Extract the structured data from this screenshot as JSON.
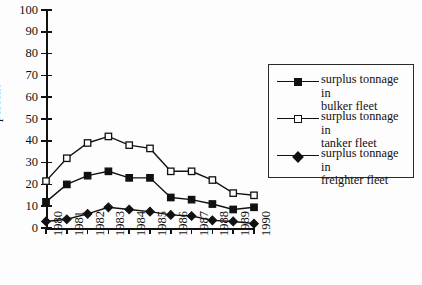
{
  "chart_data": {
    "type": "line",
    "title": "",
    "xlabel": "",
    "ylabel": "percent",
    "ylim": [
      0,
      100
    ],
    "ytick_step": 10,
    "yticks": [
      0,
      10,
      20,
      30,
      40,
      50,
      60,
      70,
      80,
      90,
      100
    ],
    "grid": false,
    "legend_position": "right",
    "categories": [
      "1980",
      "1981",
      "1982",
      "1983",
      "1984",
      "1985",
      "1986",
      "1987",
      "1988",
      "1989",
      "1990"
    ],
    "series": [
      {
        "name": "surplus tonnage in bulker fleet",
        "label_line1": "surplus tonnage in",
        "label_line2": "bulker fleet",
        "marker": "filled-square",
        "color": "#111111",
        "values": [
          12,
          20,
          24,
          26,
          23,
          23,
          14,
          13,
          11,
          8.5,
          9.5
        ]
      },
      {
        "name": "surplus tonnage in tanker fleet",
        "label_line1": "surplus tonnage in",
        "label_line2": "tanker fleet",
        "marker": "open-square",
        "color": "#111111",
        "values": [
          21.5,
          32,
          39,
          42,
          38,
          36.5,
          26,
          26,
          22,
          16,
          15
        ]
      },
      {
        "name": "surplus tonnage in freighter fleet",
        "label_line1": "surplus tonnage in",
        "label_line2": "freighter fleet",
        "marker": "filled-diamond",
        "color": "#111111",
        "values": [
          3,
          4,
          6.5,
          9.5,
          8.5,
          7.5,
          6,
          5.5,
          3.5,
          3,
          2
        ]
      }
    ]
  }
}
